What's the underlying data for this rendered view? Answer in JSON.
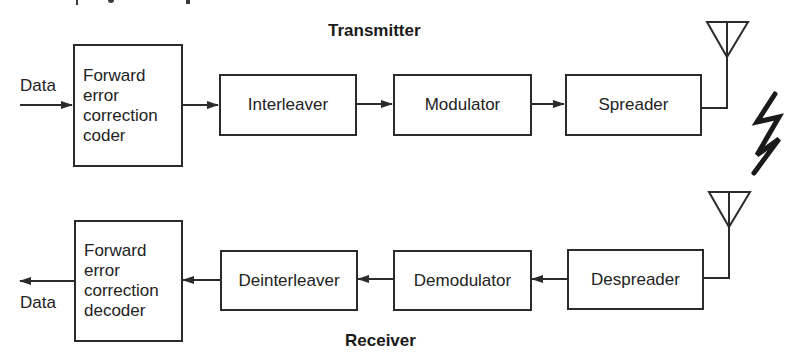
{
  "diagram": {
    "type": "block-diagram",
    "transmitter": {
      "title": "Transmitter",
      "input_label": "Data",
      "blocks": [
        {
          "id": "fec-coder",
          "lines": [
            "Forward",
            "error",
            "correction",
            "coder"
          ]
        },
        {
          "id": "interleaver",
          "label": "Interleaver"
        },
        {
          "id": "modulator",
          "label": "Modulator"
        },
        {
          "id": "spreader",
          "label": "Spreader"
        }
      ],
      "antenna": "transmit-antenna"
    },
    "channel": {
      "icon": "lightning-bolt-icon"
    },
    "receiver": {
      "title": "Receiver",
      "output_label": "Data",
      "blocks": [
        {
          "id": "despreader",
          "label": "Despreader"
        },
        {
          "id": "demodulator",
          "label": "Demodulator"
        },
        {
          "id": "deinterleaver",
          "label": "Deinterleaver"
        },
        {
          "id": "fec-decoder",
          "lines": [
            "Forward",
            "error",
            "correction",
            "decoder"
          ]
        }
      ],
      "antenna": "receive-antenna"
    },
    "colors": {
      "stroke": "#2b2b2b",
      "text": "#222222",
      "background": "#ffffff"
    }
  }
}
